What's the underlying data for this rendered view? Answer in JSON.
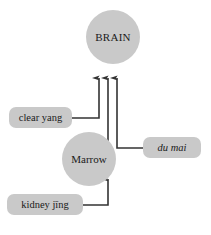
{
  "diagram": {
    "title_text": "",
    "background_color": "#ffffff",
    "node_fill_color": "#c9c9c9",
    "connector_color": "#333333",
    "text_color": "#1a1a1a",
    "nodes": [
      {
        "id": "brain",
        "label": "BRAIN",
        "shape": "circle"
      },
      {
        "id": "marrow",
        "label": "Marrow",
        "shape": "circle"
      }
    ],
    "labels": [
      {
        "id": "clear-yang",
        "text": "clear yang",
        "style": "normal"
      },
      {
        "id": "du-mai",
        "text": "du mai",
        "style": "italic"
      },
      {
        "id": "kidney-jing",
        "text": "kidney jīng",
        "style": "normal"
      }
    ],
    "connections": [
      {
        "from": "clear-yang",
        "to": "brain",
        "arrow": "up"
      },
      {
        "from": "marrow",
        "to": "brain",
        "arrow": "up"
      },
      {
        "from": "du-mai",
        "to": "brain",
        "arrow": "up"
      },
      {
        "from": "kidney-jing",
        "to": "marrow",
        "arrow": "up"
      }
    ]
  }
}
